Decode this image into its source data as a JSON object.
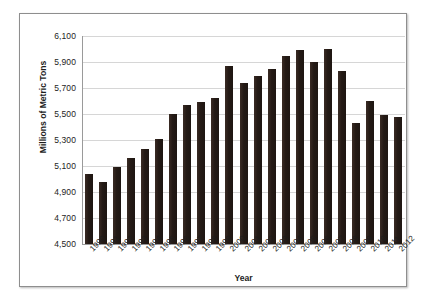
{
  "chart_data": {
    "type": "bar",
    "title": "",
    "xlabel": "Year",
    "ylabel": "Millions of Metric Tons",
    "ylim": [
      4500,
      6100
    ],
    "ytick_step": 200,
    "yticks": [
      "6,100",
      "5,900",
      "5,700",
      "5,500",
      "5,300",
      "5,100",
      "4,900",
      "4,700",
      "4,500"
    ],
    "grid": true,
    "legend": "none",
    "bar_color": "#241a15",
    "categories": [
      "1990",
      "1991",
      "1992",
      "1993",
      "1994",
      "1995",
      "1996",
      "1997",
      "1998",
      "1999",
      "2000",
      "2001",
      "2002",
      "2003",
      "2004",
      "2005",
      "2006",
      "2007",
      "2008",
      "2009",
      "2010",
      "2011",
      "2012"
    ],
    "values": [
      5040,
      4980,
      5090,
      5160,
      5230,
      5310,
      5500,
      5570,
      5590,
      5620,
      5870,
      5740,
      5790,
      5850,
      5950,
      5990,
      5900,
      6000,
      5830,
      5430,
      5600,
      5490,
      5480
    ]
  }
}
